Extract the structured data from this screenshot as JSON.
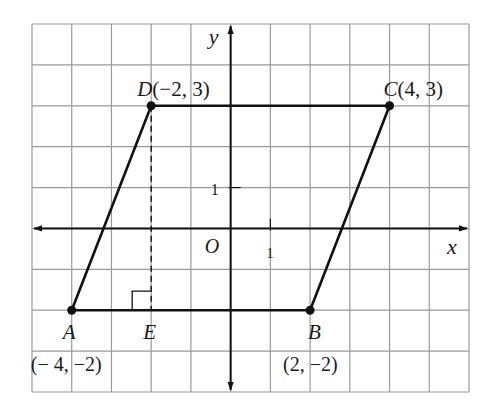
{
  "figure": {
    "type": "coordinate-plane-parallelogram",
    "grid": {
      "x_min": -5,
      "x_max": 6,
      "y_min": -4,
      "y_max": 5,
      "grid_color": "#9a9a9a",
      "line_color": "#111111"
    },
    "axes": {
      "x_label": "x",
      "y_label": "y",
      "origin_label": "O",
      "x_tick_label": "1",
      "y_tick_label": "1"
    },
    "points": [
      {
        "name": "A",
        "x": -4,
        "y": -2,
        "label": "A",
        "coord_label": "(− 4, −2)"
      },
      {
        "name": "B",
        "x": 2,
        "y": -2,
        "label": "B",
        "coord_label": "(2, −2)"
      },
      {
        "name": "C",
        "x": 4,
        "y": 3,
        "label": "C",
        "coord_label": "(4, 3)"
      },
      {
        "name": "D",
        "x": -2,
        "y": 3,
        "label": "D",
        "coord_label": "(−2, 3)"
      }
    ],
    "foot_point": {
      "name": "E",
      "x": -2,
      "y": -2,
      "label": "E"
    },
    "segments": [
      "AB",
      "BC",
      "CD",
      "DA"
    ],
    "dashed_segment": "DE",
    "right_angle_marker_at": "E"
  }
}
